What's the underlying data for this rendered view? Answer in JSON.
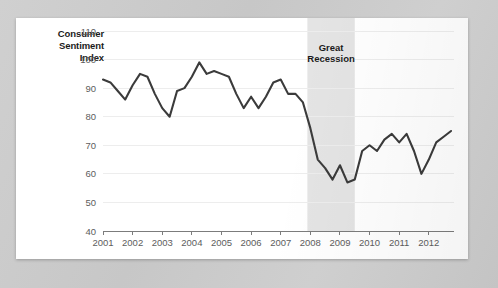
{
  "card": {
    "title_lines": [
      "Consumer",
      "Sentiment",
      "Index"
    ],
    "background_color": "#ffffff",
    "page_background_color": "#c9c9c9"
  },
  "chart_data": {
    "type": "line",
    "title": "Consumer Sentiment Index",
    "xlabel": "",
    "ylabel": "Consumer Sentiment Index",
    "ylim": [
      40,
      110
    ],
    "xlim": [
      2001,
      2012.85
    ],
    "yticks": [
      40,
      50,
      60,
      70,
      80,
      90,
      100,
      110
    ],
    "ytick_labels": [
      "40",
      "50",
      "60",
      "70",
      "80",
      "90",
      "100",
      "110"
    ],
    "xticks": [
      2001,
      2002,
      2003,
      2004,
      2005,
      2006,
      2007,
      2008,
      2009,
      2010,
      2011,
      2012
    ],
    "xtick_labels": [
      "2001",
      "2002",
      "2003",
      "2004",
      "2005",
      "2006",
      "2007",
      "2008",
      "2009",
      "2010",
      "2011",
      "2012"
    ],
    "grid": true,
    "grid_color": "#ededed",
    "legend": null,
    "line_color": "#3b3b3b",
    "series": [
      {
        "name": "Consumer Sentiment Index",
        "x": [
          2001.0,
          2001.25,
          2001.5,
          2001.75,
          2002.0,
          2002.25,
          2002.5,
          2002.75,
          2003.0,
          2003.25,
          2003.5,
          2003.75,
          2004.0,
          2004.25,
          2004.5,
          2004.75,
          2005.0,
          2005.25,
          2005.5,
          2005.75,
          2006.0,
          2006.25,
          2006.5,
          2006.75,
          2007.0,
          2007.25,
          2007.5,
          2007.75,
          2008.0,
          2008.25,
          2008.5,
          2008.75,
          2009.0,
          2009.25,
          2009.5,
          2009.75,
          2010.0,
          2010.25,
          2010.5,
          2010.75,
          2011.0,
          2011.25,
          2011.5,
          2011.75,
          2012.0,
          2012.25,
          2012.5,
          2012.75
        ],
        "values": [
          93,
          92,
          89,
          86,
          91,
          95,
          94,
          88,
          83,
          80,
          89,
          90,
          94,
          99,
          95,
          96,
          95,
          94,
          88,
          83,
          87,
          83,
          87,
          92,
          93,
          88,
          88,
          85,
          76,
          65,
          62,
          58,
          63,
          57,
          58,
          68,
          70,
          68,
          72,
          74,
          71,
          74,
          68,
          60,
          65,
          71,
          73,
          75
        ]
      }
    ],
    "annotations": [
      {
        "name": "great-recession-band",
        "label_lines": [
          "Great",
          "Recession"
        ],
        "x_start": 2007.9,
        "x_end": 2009.5,
        "fill": "#e4e4e4",
        "label_y": 103
      }
    ]
  }
}
